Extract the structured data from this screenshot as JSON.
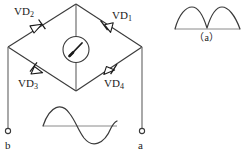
{
  "figure": {
    "type": "circuit-schematic",
    "width": 248,
    "height": 158,
    "stroke_color": "#3a3a3a",
    "text_color": "#1a1a1a",
    "background_color": "#ffffff"
  },
  "diodes": [
    {
      "id": "VD1",
      "label": "VD",
      "subscript": "1",
      "position": "upper-right",
      "orientation": "points-down-left"
    },
    {
      "id": "VD2",
      "label": "VD",
      "subscript": "2",
      "position": "upper-left",
      "orientation": "points-up-left"
    },
    {
      "id": "VD3",
      "label": "VD",
      "subscript": "3",
      "position": "lower-left",
      "orientation": "points-up-left"
    },
    {
      "id": "VD4",
      "label": "VD",
      "subscript": "4",
      "position": "lower-right",
      "orientation": "points-up-left"
    }
  ],
  "meter": {
    "name": "galvanometer",
    "shape": "circle",
    "needle_direction": "up-right"
  },
  "terminals": [
    {
      "id": "b",
      "label": "b",
      "side": "left"
    },
    {
      "id": "a",
      "label": "a",
      "side": "right"
    }
  ],
  "waveforms": [
    {
      "id": "input-sine",
      "name": "input-sine-wave",
      "description": "full sinusoid, one positive half then one negative half",
      "caption": ""
    },
    {
      "id": "output-rectified",
      "name": "rectified-waveform",
      "description": "full-wave rectified: two positive humps",
      "caption": "（a）"
    }
  ],
  "captions": {
    "a": "（a）"
  }
}
